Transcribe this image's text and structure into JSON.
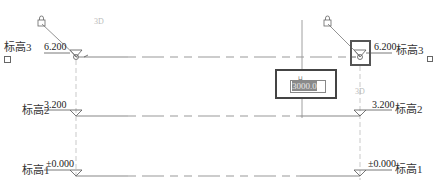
{
  "view": {
    "type": "elevation-view",
    "line_color": "#777777",
    "dash_color": "#999999",
    "selection_color": "#555555"
  },
  "levels": [
    {
      "name": "标高3",
      "elevation": "6.200",
      "y": 56,
      "show_3d_left": true,
      "show_3d_right": false
    },
    {
      "name": "标高2",
      "elevation": "3.200",
      "y": 115
    },
    {
      "name": "标高1",
      "elevation": "±0.000",
      "y": 176
    }
  ],
  "tags": {
    "three_d_left": "3D",
    "three_d_right": "3D"
  },
  "temp_dimension": {
    "value": "3000.0",
    "lock_label": "⊔"
  },
  "icons": {
    "lock": "lock-icon",
    "hide_bubble": "checkbox-icon"
  }
}
